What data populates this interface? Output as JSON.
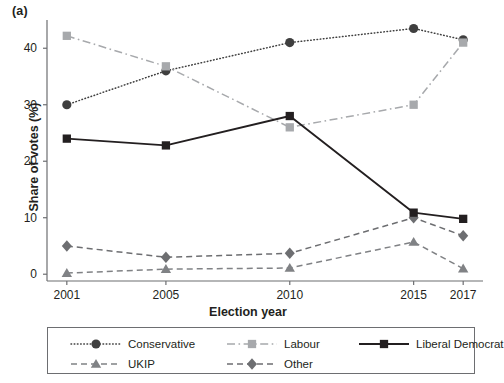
{
  "figure": {
    "panel_label": "(a)"
  },
  "chart_data": {
    "type": "line",
    "title": "",
    "subtitle": "",
    "xlabel": "Election year",
    "ylabel": "Share of votes (%)",
    "categories": [
      "2001",
      "2005",
      "2010",
      "2015",
      "2017"
    ],
    "x": [
      2001,
      2005,
      2010,
      2015,
      2017
    ],
    "xlim": [
      2000.2,
      2017.8
    ],
    "ylim": [
      -1.2,
      45
    ],
    "yticks": [
      0,
      10,
      20,
      30,
      40
    ],
    "ytick_labels": [
      "0",
      "10",
      "20",
      "30",
      "40"
    ],
    "xtick_labels": [
      "2001",
      "2005",
      "2010",
      "2015",
      "2017"
    ],
    "grid": false,
    "legend_position": "below",
    "series": [
      {
        "name": "Conservative",
        "values": [
          30.0,
          36.0,
          41.0,
          43.5,
          41.5
        ],
        "color": "#3f3f3f",
        "marker": "circle",
        "linestyle": "dotted"
      },
      {
        "name": "UKIP",
        "values": [
          0.2,
          0.9,
          1.1,
          5.7,
          1.0
        ],
        "color": "#808285",
        "marker": "triangle",
        "linestyle": "dashed"
      },
      {
        "name": "Labour",
        "values": [
          42.2,
          36.8,
          26.0,
          30.0,
          41.0
        ],
        "color": "#a7a9ac",
        "marker": "square",
        "linestyle": "dashdot"
      },
      {
        "name": "Other",
        "values": [
          5.0,
          3.0,
          3.7,
          10.0,
          6.8
        ],
        "color": "#6d6e71",
        "marker": "diamond",
        "linestyle": "dashed"
      },
      {
        "name": "Liberal Democrat",
        "values": [
          24.0,
          22.8,
          28.0,
          10.9,
          9.8
        ],
        "color": "#231f20",
        "marker": "square",
        "linestyle": "solid"
      }
    ]
  },
  "legend": {
    "entries": [
      {
        "label": "Conservative"
      },
      {
        "label": "Labour"
      },
      {
        "label": "Liberal Democrat"
      },
      {
        "label": "UKIP"
      },
      {
        "label": "Other"
      }
    ]
  }
}
